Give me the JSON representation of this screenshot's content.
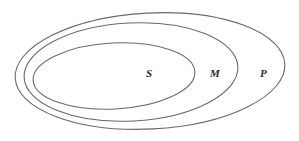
{
  "diagram": {
    "type": "nested-euler-diagram",
    "sets": [
      {
        "label": "P",
        "role": "outermost",
        "ellipse": {
          "cx": 150,
          "cy": 71,
          "rx": 135,
          "ry": 58
        },
        "label_pos": {
          "x": 263,
          "y": 77
        }
      },
      {
        "label": "M",
        "role": "middle",
        "ellipse": {
          "cx": 131,
          "cy": 72,
          "rx": 107,
          "ry": 49
        },
        "label_pos": {
          "x": 215,
          "y": 77
        }
      },
      {
        "label": "S",
        "role": "innermost",
        "ellipse": {
          "cx": 114,
          "cy": 76,
          "rx": 81,
          "ry": 33
        },
        "label_pos": {
          "x": 149,
          "y": 77
        }
      }
    ],
    "stroke_color": "#6a6a6a",
    "label_color": "#2a2a2a",
    "background": "#ffffff"
  }
}
